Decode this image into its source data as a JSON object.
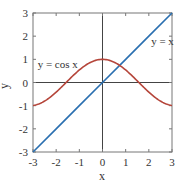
{
  "chart_data": {
    "type": "line",
    "title": "",
    "xlabel": "x",
    "ylabel": "y",
    "xlim": [
      -3,
      3
    ],
    "ylim": [
      -3,
      3
    ],
    "xticks": [
      -3,
      -2,
      -1,
      0,
      1,
      2,
      3
    ],
    "yticks": [
      -3,
      -2,
      -1,
      0,
      1,
      2,
      3
    ],
    "xtick_labels": [
      "-3",
      "-2",
      "-1",
      "0",
      "1",
      "2",
      "3"
    ],
    "ytick_labels": [
      "-3",
      "-2",
      "-1",
      "0",
      "1",
      "2",
      "3"
    ],
    "grid": false,
    "axes_lines_through_origin": true,
    "legend": null,
    "series": [
      {
        "name": "y = x",
        "color": "#2a6fb0",
        "x": [
          -3,
          -2,
          -1,
          0,
          1,
          2,
          3
        ],
        "y": [
          -3,
          -2,
          -1,
          0,
          1,
          2,
          3
        ]
      },
      {
        "name": "y = cos x",
        "color": "#b5453a",
        "x": [
          -3,
          -2.5,
          -2,
          -1.5,
          -1,
          -0.5,
          0,
          0.5,
          1,
          1.5,
          2,
          2.5,
          3
        ],
        "y": [
          -0.99,
          -0.8,
          -0.42,
          0.07,
          0.54,
          0.88,
          1.0,
          0.88,
          0.54,
          0.07,
          -0.42,
          -0.8,
          -0.99
        ]
      }
    ],
    "annotations": [
      {
        "text": "y = cos x",
        "x": -2.8,
        "y": 0.8
      },
      {
        "text": "y = x",
        "x": 2.1,
        "y": 1.8
      }
    ]
  },
  "colors": {
    "frame": "#777777",
    "axis_lines": "#444444",
    "text": "#333333"
  }
}
